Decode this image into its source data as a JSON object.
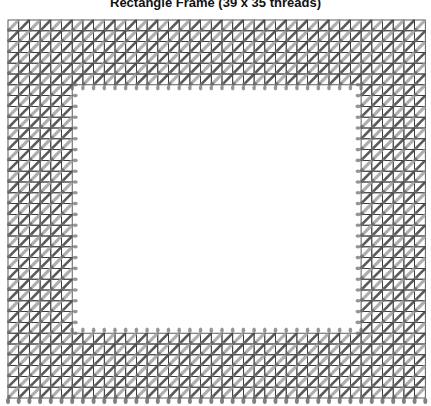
{
  "title": "Rectangle Frame (39 x 35 threads)",
  "grid": {
    "columns": 39,
    "rows": 35,
    "left": 8,
    "top": 20,
    "cell_w": 10.7,
    "cell_h": 10.8,
    "line_color": "#333333",
    "opening": {
      "col_start": 6,
      "col_end": 33,
      "row_start": 6,
      "row_end": 29
    }
  },
  "stitches": {
    "dark_color": "#4a4a4a",
    "light_color": "#9a9a9a",
    "dot_color": "#6a6a6a"
  }
}
